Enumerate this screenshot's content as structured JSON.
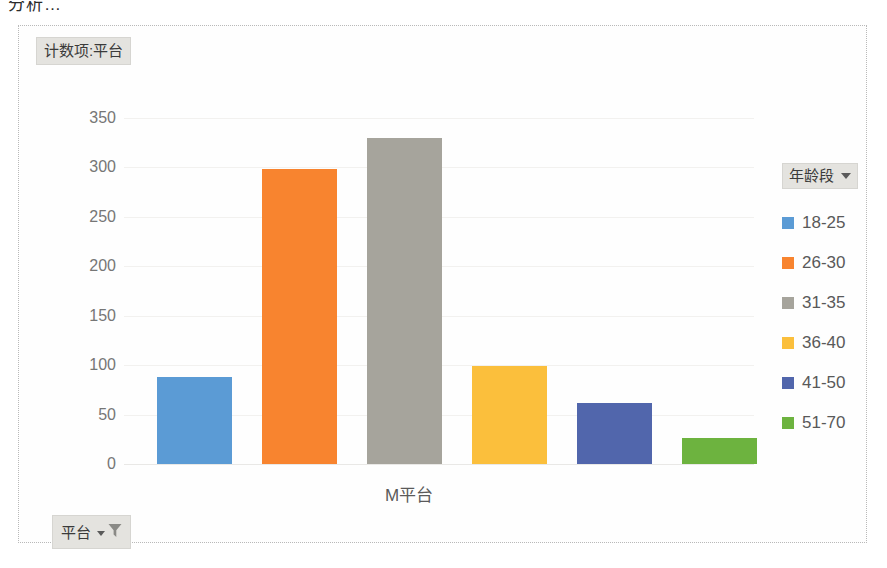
{
  "page": {
    "top_cut_text": "分析…"
  },
  "chart_title_button": {
    "label": "计数项:平台"
  },
  "legend": {
    "field_label": "年龄段",
    "caret_icon": "chevron-down-icon",
    "items": [
      {
        "label": "18-25",
        "color": "#5B9BD5"
      },
      {
        "label": "26-30",
        "color": "#F8842F"
      },
      {
        "label": "31-35",
        "color": "#A6A49C"
      },
      {
        "label": "36-40",
        "color": "#FBBF3C"
      },
      {
        "label": "41-50",
        "color": "#5166AC"
      },
      {
        "label": "51-70",
        "color": "#6DB33F"
      }
    ]
  },
  "filter_button": {
    "label": "平台",
    "caret_icon": "chevron-down-icon",
    "funnel_icon": "filter-funnel-icon"
  },
  "chart_data": {
    "type": "bar",
    "title": "计数项:平台",
    "xlabel": "M平台",
    "ylabel": "",
    "categories": [
      "18-25",
      "26-30",
      "31-35",
      "36-40",
      "41-50",
      "51-70"
    ],
    "values": [
      88,
      298,
      330,
      99,
      62,
      26
    ],
    "colors": [
      "#5B9BD5",
      "#F8842F",
      "#A6A49C",
      "#FBBF3C",
      "#5166AC",
      "#6DB33F"
    ],
    "series": [
      {
        "name": "计数项:平台",
        "values": [
          88,
          298,
          330,
          99,
          62,
          26
        ]
      }
    ],
    "legend_title": "年龄段",
    "legend_position": "right",
    "ylim": [
      0,
      350
    ],
    "yticks": [
      350,
      300,
      250,
      200,
      150,
      100,
      50,
      0
    ],
    "ytick_labels": [
      "350",
      "300",
      "250",
      "200",
      "150",
      "100",
      "50",
      "0"
    ],
    "grid": true,
    "x_categories_axis": [
      "M平台"
    ]
  }
}
